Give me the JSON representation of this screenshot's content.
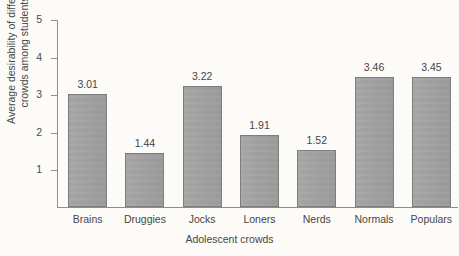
{
  "chart_data": {
    "type": "bar",
    "title": "",
    "subtitle": "",
    "xlabel": "Adolescent crowds",
    "ylabel": "Average desirability of different crowds among students",
    "ylabel_line1": "Average desirability of different",
    "ylabel_line2": "crowds among students",
    "categories": [
      "Brains",
      "Druggies",
      "Jocks",
      "Loners",
      "Nerds",
      "Normals",
      "Populars"
    ],
    "values": [
      3.01,
      1.44,
      3.22,
      1.91,
      1.52,
      3.46,
      3.45
    ],
    "value_labels": [
      "3.01",
      "1.44",
      "3.22",
      "1.91",
      "1.52",
      "3.46",
      "3.45"
    ],
    "ylim": [
      0,
      5
    ],
    "ytick_values": [
      1,
      2,
      3,
      4,
      5
    ],
    "ytick_labels": [
      "1",
      "2",
      "3",
      "4",
      "5"
    ],
    "grid": false,
    "legend": false,
    "legend_position": "none",
    "bar_color": "#a2a2a2",
    "bar_border_color": "#7d7d7d",
    "axis_color": "#8e8e8e",
    "text_color": "#464646",
    "background_color": "#fcfbf8"
  }
}
